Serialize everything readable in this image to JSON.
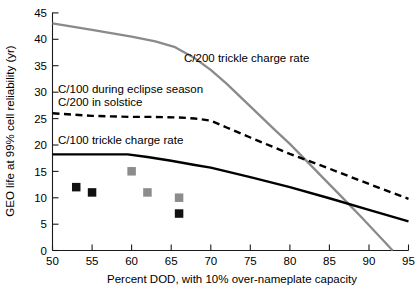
{
  "figure": {
    "background": "#ffffff",
    "colors": {
      "axis": "#1a1a1a",
      "gray_series": "#8a8a8a",
      "black_series": "#000000",
      "marker_black": "#111111",
      "marker_gray": "#8c8c8c"
    }
  },
  "chart_data": {
    "type": "line",
    "title": "",
    "xlabel": "Percent DOD, with 10% over-nameplate capacity",
    "ylabel": "GEO life at 99% cell reliability (yr)",
    "xlim": [
      50,
      95
    ],
    "ylim": [
      0,
      45
    ],
    "xticks": [
      50,
      55,
      60,
      65,
      70,
      75,
      80,
      85,
      90,
      95
    ],
    "yticks": [
      0,
      5,
      10,
      15,
      20,
      25,
      30,
      35,
      40,
      45
    ],
    "xtick_labels": [
      "50",
      "55",
      "60",
      "65",
      "70",
      "75",
      "80",
      "85",
      "90",
      "95"
    ],
    "ytick_labels": [
      "0",
      "5",
      "10",
      "15",
      "20",
      "25",
      "30",
      "35",
      "40",
      "45"
    ],
    "grid": false,
    "legend": "inline-annotations",
    "series": [
      {
        "name": "C/200 trickle charge rate",
        "style": "solid",
        "color": "#8a8a8a",
        "annotation": "C/200 trickle charge rate",
        "x": [
          50,
          55,
          60,
          63,
          65.5,
          68,
          70,
          72,
          75,
          78,
          80,
          83,
          86,
          89,
          93
        ],
        "y": [
          43.0,
          41.8,
          40.5,
          39.6,
          38.5,
          36.4,
          34.2,
          31.6,
          27.3,
          23.0,
          20.2,
          15.6,
          11.0,
          6.4,
          0.0
        ]
      },
      {
        "name": "C/100 during eclipse season, C/200 in solstice",
        "style": "dashed",
        "color": "#000000",
        "annotation": "C/100 during eclipse season\nC/200 in solstice",
        "x": [
          50,
          55,
          60,
          63,
          66,
          68,
          70,
          72,
          75,
          80,
          85,
          90,
          95
        ],
        "y": [
          26.0,
          25.5,
          25.3,
          25.3,
          25.2,
          25.0,
          24.6,
          23.3,
          21.4,
          18.3,
          15.5,
          12.6,
          9.8
        ]
      },
      {
        "name": "C/100 trickle charge rate",
        "style": "solid",
        "color": "#000000",
        "annotation": "C/100 trickle charge rate",
        "x": [
          50,
          55,
          59.5,
          62,
          65,
          68,
          70,
          75,
          80,
          85,
          90,
          95
        ],
        "y": [
          18.2,
          18.2,
          18.2,
          17.7,
          17.0,
          16.2,
          15.7,
          13.9,
          12.0,
          9.9,
          7.7,
          5.5
        ]
      }
    ],
    "scatter_points": [
      {
        "x": 53,
        "y": 12,
        "color": "#111111",
        "group": "black"
      },
      {
        "x": 55,
        "y": 11,
        "color": "#111111",
        "group": "black"
      },
      {
        "x": 66,
        "y": 7,
        "color": "#111111",
        "group": "black"
      },
      {
        "x": 60,
        "y": 15,
        "color": "#8c8c8c",
        "group": "gray"
      },
      {
        "x": 62,
        "y": 11,
        "color": "#8c8c8c",
        "group": "gray"
      },
      {
        "x": 66,
        "y": 10,
        "color": "#8c8c8c",
        "group": "gray"
      }
    ],
    "annotations": [
      {
        "id": "annot-c200",
        "text": "C/200 trickle charge rate",
        "x": 66.5,
        "y": 32.5
      },
      {
        "id": "annot-eclipse-1",
        "text": "C/100 during eclipse season",
        "x": 51.0,
        "y": 30.2
      },
      {
        "id": "annot-eclipse-2",
        "text": "C/200 in solstice",
        "x": 51.0,
        "y": 27.9
      },
      {
        "id": "annot-c100",
        "text": "C/100 trickle charge rate",
        "x": 51.0,
        "y": 20.4
      }
    ]
  }
}
